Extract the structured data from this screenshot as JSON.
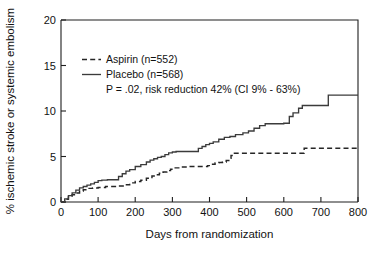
{
  "chart_data": {
    "type": "line",
    "title": "",
    "xlabel": "Days from randomization",
    "ylabel": "% ischemic stroke or systemic embolism",
    "xlim": [
      0,
      800
    ],
    "ylim": [
      0,
      20
    ],
    "xticks": [
      0,
      100,
      200,
      300,
      400,
      500,
      600,
      700,
      800
    ],
    "yticks": [
      0,
      5,
      10,
      15,
      20
    ],
    "xtick_labels": [
      "0",
      "100",
      "200",
      "300",
      "400",
      "500",
      "600",
      "700",
      "800"
    ],
    "ytick_labels": [
      "0",
      "5",
      "10",
      "15",
      "20"
    ],
    "grid": false,
    "legend_position": "upper-left-inside",
    "style": "kaplan-meier step curves",
    "annotations": [
      "P = .02, risk reduction 42% (CI 9% - 63%)"
    ],
    "series": [
      {
        "name": "Aspirin (n=552)",
        "label": "Aspirin (n=552)",
        "n": 552,
        "linestyle": "dashed",
        "color": "#262626",
        "final_value": 5.9,
        "x": [
          0,
          10,
          20,
          30,
          40,
          50,
          60,
          70,
          85,
          100,
          120,
          150,
          170,
          185,
          200,
          215,
          230,
          245,
          255,
          265,
          275,
          285,
          295,
          305,
          320,
          340,
          360,
          380,
          395,
          405,
          415,
          425,
          435,
          445,
          452,
          458,
          465,
          520,
          600,
          645,
          655,
          720,
          800
        ],
        "y": [
          0,
          0.3,
          0.55,
          0.8,
          1.0,
          1.2,
          1.35,
          1.5,
          1.55,
          1.6,
          1.7,
          1.75,
          1.9,
          2.1,
          2.25,
          2.4,
          2.6,
          2.85,
          3.0,
          3.15,
          3.3,
          3.45,
          3.6,
          3.75,
          3.85,
          3.9,
          3.9,
          3.9,
          4.0,
          4.15,
          4.3,
          4.35,
          4.4,
          4.55,
          4.8,
          5.1,
          5.35,
          5.35,
          5.35,
          5.35,
          5.9,
          5.9,
          5.9
        ]
      },
      {
        "name": "Placebo (n=568)",
        "label": "Placebo (n=568)",
        "n": 568,
        "linestyle": "solid",
        "color": "#3b3b3b",
        "final_value": 11.8,
        "x": [
          0,
          10,
          20,
          30,
          40,
          50,
          60,
          70,
          80,
          90,
          100,
          110,
          125,
          150,
          155,
          165,
          175,
          185,
          200,
          215,
          230,
          240,
          250,
          260,
          270,
          280,
          290,
          300,
          310,
          350,
          370,
          380,
          390,
          400,
          410,
          425,
          440,
          455,
          470,
          490,
          505,
          520,
          535,
          550,
          600,
          615,
          625,
          640,
          650,
          720,
          800
        ],
        "y": [
          0,
          0.35,
          0.7,
          1.0,
          1.3,
          1.55,
          1.7,
          1.85,
          2.0,
          2.15,
          2.35,
          2.4,
          2.45,
          2.45,
          2.8,
          3.1,
          3.4,
          3.55,
          3.9,
          4.1,
          4.4,
          4.6,
          4.75,
          4.9,
          5.0,
          5.2,
          5.4,
          5.5,
          5.55,
          5.55,
          5.9,
          6.1,
          6.3,
          6.45,
          6.6,
          6.9,
          7.1,
          7.2,
          7.4,
          7.6,
          7.8,
          8.1,
          8.4,
          8.6,
          8.65,
          9.4,
          9.8,
          10.3,
          10.6,
          11.75,
          11.75
        ]
      }
    ]
  },
  "legend": {
    "entries": [
      {
        "label": "Aspirin (n=552)",
        "style": "dashed"
      },
      {
        "label": "Placebo (n=568)",
        "style": "solid"
      }
    ],
    "note": "P = .02, risk reduction 42% (CI 9% - 63%)"
  },
  "axes": {
    "x_title": "Days from randomization",
    "y_title": "% ischemic stroke or systemic embolism"
  }
}
